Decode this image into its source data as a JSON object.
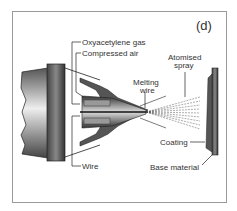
{
  "figure": {
    "panel_label": "(d)",
    "labels": {
      "oxyacetylene_gas": "Oxyacetylene gas",
      "compressed_air": "Compressed air",
      "melting_wire_1": "Melting",
      "melting_wire_2": "wire",
      "atomised_spray_1": "Atomised",
      "atomised_spray_2": "spray",
      "coating": "Coating",
      "base_material": "Base material",
      "wire": "Wire"
    }
  }
}
